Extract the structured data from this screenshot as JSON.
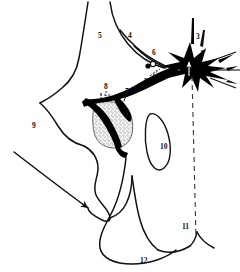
{
  "figure": {
    "background_color": "#ffffff",
    "ink_color": "#111111",
    "fill_color": "#000000",
    "stipple_color": "#4a4a4a",
    "width": 240,
    "height": 272
  },
  "labels": [
    {
      "id": "label-5-top",
      "text": "5",
      "x": 98,
      "y": 32,
      "color": "dark"
    },
    {
      "id": "label-4",
      "text": "4",
      "x": 128,
      "y": 32,
      "color": "dark"
    },
    {
      "id": "label-6",
      "text": "6",
      "x": 152,
      "y": 49,
      "color": "dark"
    },
    {
      "id": "label-3",
      "text": "3",
      "x": 196,
      "y": 33,
      "color": "dark"
    },
    {
      "id": "label-1-prime",
      "text": "1'",
      "x": 200,
      "y": 50,
      "color": "dark"
    },
    {
      "id": "label-5-prime",
      "text": "5''",
      "x": 144,
      "y": 77,
      "color": "dark"
    },
    {
      "id": "label-8",
      "text": "8",
      "x": 104,
      "y": 83,
      "color": "dark"
    },
    {
      "id": "label-7",
      "text": "7",
      "x": 125,
      "y": 88,
      "color": "dark"
    },
    {
      "id": "label-2",
      "text": "2",
      "x": 148,
      "y": 93,
      "color": "white"
    },
    {
      "id": "label-9",
      "text": "9",
      "x": 32,
      "y": 122,
      "color": "dark"
    },
    {
      "id": "label-9-prime",
      "text": "9'",
      "x": 110,
      "y": 131,
      "color": "dark"
    },
    {
      "id": "label-10",
      "text": "10",
      "x": 160,
      "y": 143,
      "color": "dark"
    },
    {
      "id": "label-11",
      "text": "11",
      "x": 182,
      "y": 223,
      "color": "dark"
    },
    {
      "id": "label-12",
      "text": "12",
      "x": 140,
      "y": 257,
      "color": "dark"
    }
  ],
  "annotations": {
    "dashed_axis": "vertical dashed midline",
    "arrow_up_in_star": "white up arrow inside black star",
    "circles_pair": "two small circles near label 5''",
    "stipple_region": "dotted/stippled shading near label 9'"
  }
}
